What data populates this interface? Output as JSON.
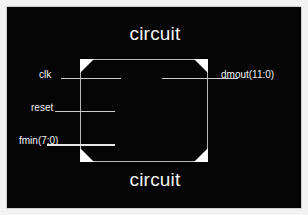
{
  "figure": {
    "background_color": "#050505",
    "frame_color": "#cfcfcf",
    "wire_color": "#cdcdcd",
    "text_color": "#f2f2f2",
    "corner_marker_color": "#ffffff"
  },
  "block": {
    "title_top": "circuit",
    "title_bottom": "circuit"
  },
  "ports": {
    "inputs": [
      {
        "name": "clk",
        "label": "clk"
      },
      {
        "name": "reset",
        "label": "reset"
      },
      {
        "name": "fmin",
        "label": "fmin(7:0)"
      }
    ],
    "outputs": [
      {
        "name": "dmout",
        "label": "dmout(11:0)"
      }
    ]
  }
}
